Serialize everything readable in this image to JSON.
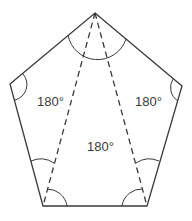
{
  "diagram": {
    "type": "pentagon-triangulation",
    "colors": {
      "stroke": "#3a3a3a",
      "background": "#ffffff"
    },
    "labels": {
      "left_triangle": "180°",
      "right_triangle": "180°",
      "center_triangle": "180°"
    }
  }
}
